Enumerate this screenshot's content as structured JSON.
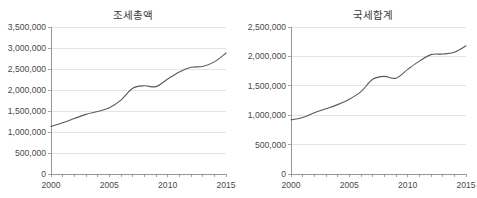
{
  "chart_data": [
    {
      "type": "line",
      "panel": "left",
      "title": "조세총액",
      "xlabel": "",
      "ylabel": "",
      "xlim": [
        2000,
        2015
      ],
      "ylim": [
        0,
        3500000
      ],
      "ytick_values": [
        0,
        500000,
        1000000,
        1500000,
        2000000,
        2500000,
        3000000,
        3500000
      ],
      "ytick_labels": [
        "0",
        "500,000",
        "1,000,000",
        "1,500,000",
        "2,000,000",
        "2,500,000",
        "3,000,000",
        "3,500,000"
      ],
      "xtick_values": [
        2000,
        2001,
        2002,
        2003,
        2004,
        2005,
        2006,
        2007,
        2008,
        2009,
        2010,
        2011,
        2012,
        2013,
        2014,
        2015
      ],
      "xtick_labels": [
        "2000",
        "",
        "",
        "",
        "",
        "2005",
        "",
        "",
        "",
        "",
        "2010",
        "",
        "",
        "",
        "",
        "2015"
      ],
      "grid": true,
      "legend": "none",
      "line_color": "#595959",
      "x": [
        2000,
        2001,
        2002,
        2003,
        2004,
        2005,
        2006,
        2007,
        2008,
        2009,
        2010,
        2011,
        2012,
        2013,
        2014,
        2015
      ],
      "values": [
        1130000,
        1220000,
        1320000,
        1420000,
        1490000,
        1580000,
        1760000,
        2040000,
        2100000,
        2080000,
        2260000,
        2430000,
        2540000,
        2560000,
        2670000,
        2880000
      ]
    },
    {
      "type": "line",
      "panel": "right",
      "title": "국세합계",
      "xlabel": "",
      "ylabel": "",
      "xlim": [
        2000,
        2015
      ],
      "ylim": [
        0,
        2500000
      ],
      "ytick_values": [
        0,
        500000,
        1000000,
        1500000,
        2000000,
        2500000
      ],
      "ytick_labels": [
        "0",
        "500,000",
        "1,000,000",
        "1,500,000",
        "2,000,000",
        "2,500,000"
      ],
      "xtick_values": [
        2000,
        2001,
        2002,
        2003,
        2004,
        2005,
        2006,
        2007,
        2008,
        2009,
        2010,
        2011,
        2012,
        2013,
        2014,
        2015
      ],
      "xtick_labels": [
        "2000",
        "",
        "",
        "",
        "",
        "2005",
        "",
        "",
        "",
        "",
        "2010",
        "",
        "",
        "",
        "",
        "2015"
      ],
      "grid": true,
      "legend": "none",
      "line_color": "#595959",
      "x": [
        2000,
        2001,
        2002,
        2003,
        2004,
        2005,
        2006,
        2007,
        2008,
        2009,
        2010,
        2011,
        2012,
        2013,
        2014,
        2015
      ],
      "values": [
        920000,
        960000,
        1040000,
        1110000,
        1180000,
        1270000,
        1400000,
        1610000,
        1660000,
        1630000,
        1780000,
        1920000,
        2030000,
        2040000,
        2070000,
        2180000
      ]
    }
  ]
}
